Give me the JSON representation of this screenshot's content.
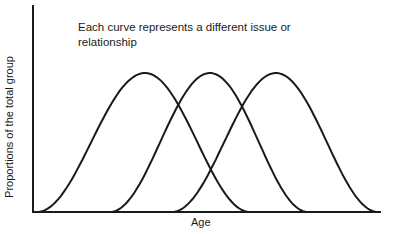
{
  "chart_data": {
    "type": "line",
    "title": "",
    "annotation": "Each curve represents a different issue or relationship",
    "xlabel": "Age",
    "ylabel": "Proportions of the total group",
    "grid": false,
    "legend": null,
    "x_ticks": [],
    "y_ticks": [],
    "series": [
      {
        "name": "Curve 1",
        "shape": "bell",
        "start_x_px": 37,
        "peak_x_px": 145,
        "end_x_px": 250,
        "relative_peak": 1.0
      },
      {
        "name": "Curve 2",
        "shape": "bell",
        "start_x_px": 110,
        "peak_x_px": 210,
        "end_x_px": 308,
        "relative_peak": 1.0
      },
      {
        "name": "Curve 3",
        "shape": "bell",
        "start_x_px": 172,
        "peak_x_px": 276,
        "end_x_px": 378,
        "relative_peak": 1.0
      }
    ]
  },
  "labels": {
    "annotation_line1": "Each curve represents a different issue or",
    "annotation_line2": "relationship",
    "xlabel": "Age",
    "ylabel": "Proportions of the total group"
  },
  "colors": {
    "line": "#1a1a1a",
    "background": "#ffffff"
  }
}
